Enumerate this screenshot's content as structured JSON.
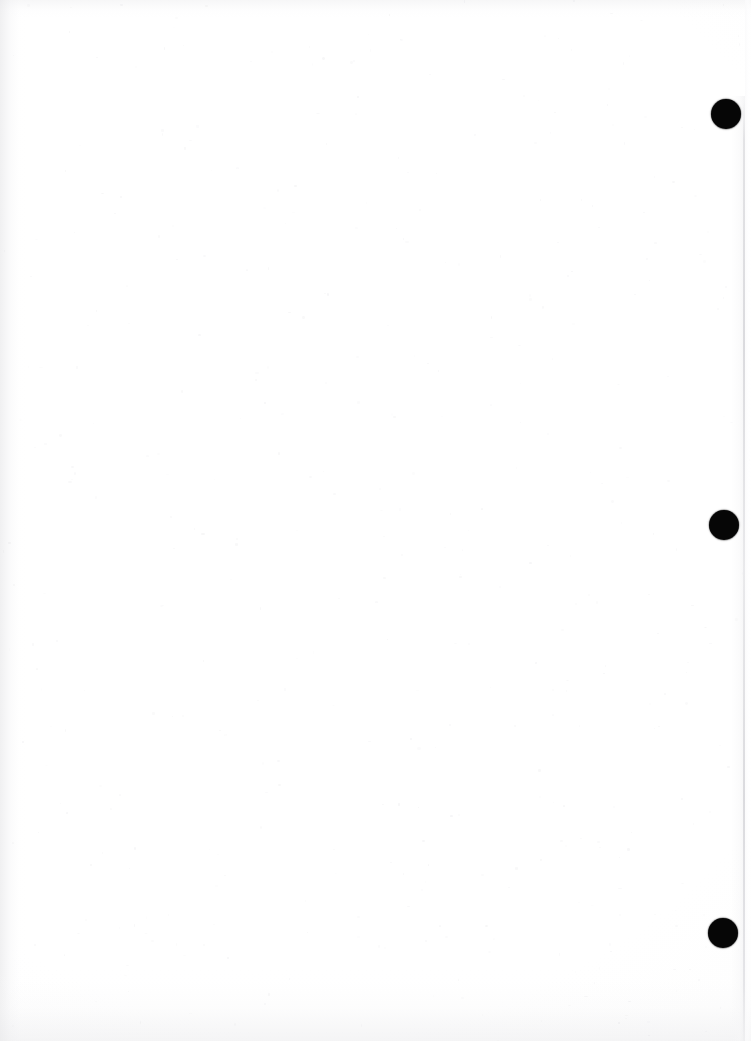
{
  "document": {
    "kind": "scanned-page",
    "page_state": "blank",
    "visible_text": "",
    "width_px": 751,
    "height_px": 1041,
    "background_color": "#ffffff",
    "paper_tone": "#fdfdfd"
  },
  "marks": {
    "ink_color": "#060606",
    "description": "three solid black round punch/binding holes aligned vertically near the right edge",
    "holes": [
      {
        "name": "top-hole",
        "cx": 726,
        "cy": 114,
        "diameter": 30
      },
      {
        "name": "middle-hole",
        "cx": 724,
        "cy": 525,
        "diameter": 30
      },
      {
        "name": "bottom-hole",
        "cx": 723,
        "cy": 933,
        "diameter": 30
      }
    ]
  },
  "artifacts": {
    "page_edge_line": {
      "name": "right-page-edge",
      "x": 743,
      "y_start": 102,
      "y_end": 1041,
      "color": "#d6d6da"
    },
    "left_margin_shading": {
      "width": 26,
      "color": "#e4e4e6"
    },
    "top_shading": {
      "height": 18,
      "color": "#e9e9eb"
    },
    "bottom_shading": {
      "height": 74,
      "color": "#eaeaec"
    },
    "grain_color": "#d9d9dd"
  }
}
